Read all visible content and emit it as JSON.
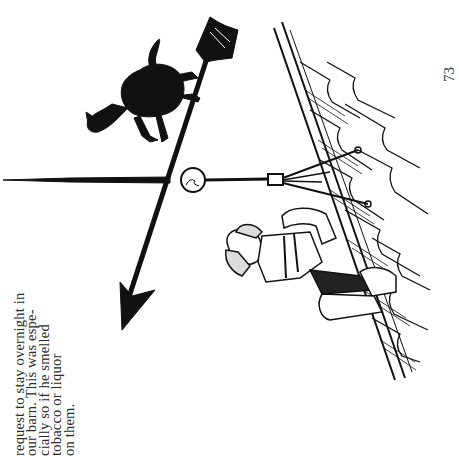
{
  "page": {
    "orientation": "rotated -90deg (text reads bottom-to-top)",
    "page_number": "73",
    "text_lines": [
      "",
      "request to stay overnight in",
      "our barn. This was espe-",
      "cially so if he smelled",
      "tobacco or liquor",
      "on them."
    ]
  },
  "illustration": {
    "subject": "weathervane with running horse and arrow on a shingled barn roof, man climbing the roof",
    "colors": {
      "ink": "#111111",
      "paper": "#ffffff"
    }
  }
}
